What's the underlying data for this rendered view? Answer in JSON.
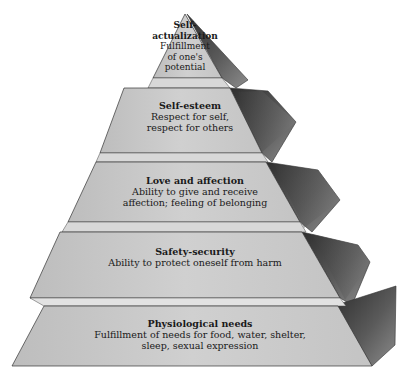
{
  "diagram": {
    "type": "pyramid",
    "colors": {
      "front_face": "#c8c8c8",
      "ledge": "#dcdcdc",
      "side_dark": "#4a4a4a",
      "side_light": "#9a9a9a",
      "outline": "#333333"
    },
    "tiers": [
      {
        "level": 5,
        "title": "Self-actualization",
        "title_lines": [
          "Self-",
          "actualization"
        ],
        "description": "Fulfillment of one's potential",
        "desc_lines": [
          "Fulfillment",
          "of one's",
          "potential"
        ]
      },
      {
        "level": 4,
        "title": "Self-esteem",
        "description": "Respect for self, respect for others",
        "desc_lines": [
          "Respect for self,",
          "respect for others"
        ]
      },
      {
        "level": 3,
        "title": "Love and affection",
        "description": "Ability to give and receive affection; feeling of belonging",
        "desc_lines": [
          "Ability to give and receive",
          "affection; feeling of belonging"
        ]
      },
      {
        "level": 2,
        "title": "Safety-security",
        "description": "Ability to protect oneself from harm",
        "desc_lines": [
          "Ability to protect oneself from harm"
        ]
      },
      {
        "level": 1,
        "title": "Physiological needs",
        "description": "Fulfillment of needs for food, water, shelter, sleep, sexual expression",
        "desc_lines": [
          "Fulfillment of needs for food, water, shelter,",
          "sleep, sexual expression"
        ]
      }
    ]
  }
}
